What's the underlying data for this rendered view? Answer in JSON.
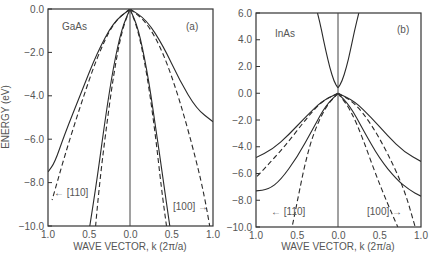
{
  "figure": {
    "shared_xlabel": "WAVE VECTOR, k (2π/a)",
    "shared_ylabel": "ENERGY (eV)"
  },
  "chart_data": [
    {
      "type": "line",
      "panel_label": "(a)",
      "material": "GaAs",
      "title": "GaAs",
      "xlabel": "WAVE VECTOR, k (2π/a)",
      "ylabel": "ENERGY (eV)",
      "x_ticks": [
        "1.0",
        "0.5",
        "0.0",
        "0.5",
        "1.0"
      ],
      "y_ticks": [
        "0.0",
        "−2.0",
        "−4.0",
        "−6.0",
        "−8.0",
        "−10.0"
      ],
      "ylim": [
        -10.0,
        0.0
      ],
      "xlim_left": [
        1.0,
        0.0
      ],
      "xlim_right": [
        0.0,
        1.0
      ],
      "direction_labels": {
        "left": "← [110]",
        "right": "[100] →"
      },
      "grid": false,
      "series": [
        {
          "name": "heavy hole [110] (solid)",
          "style": "solid",
          "side": "left",
          "points": [
            [
              0.0,
              0.0
            ],
            [
              0.2,
              -0.6
            ],
            [
              0.4,
              -2.0
            ],
            [
              0.6,
              -3.9
            ],
            [
              0.8,
              -5.8
            ],
            [
              0.92,
              -7.1
            ],
            [
              1.0,
              -7.5
            ]
          ]
        },
        {
          "name": "heavy hole [110] (model, dashed)",
          "style": "dashed",
          "side": "left",
          "points": [
            [
              0.0,
              0.0
            ],
            [
              0.2,
              -0.6
            ],
            [
              0.4,
              -2.2
            ],
            [
              0.6,
              -4.4
            ],
            [
              0.8,
              -6.8
            ],
            [
              0.95,
              -8.8
            ]
          ]
        },
        {
          "name": "light hole [110] (solid)",
          "style": "solid",
          "side": "left",
          "points": [
            [
              0.0,
              0.0
            ],
            [
              0.1,
              -0.9
            ],
            [
              0.2,
              -2.6
            ],
            [
              0.3,
              -5.0
            ],
            [
              0.4,
              -7.8
            ],
            [
              0.49,
              -10.0
            ]
          ]
        },
        {
          "name": "light hole [110] (model, dashed)",
          "style": "dashed",
          "side": "left",
          "points": [
            [
              0.0,
              0.0
            ],
            [
              0.1,
              -1.0
            ],
            [
              0.2,
              -3.0
            ],
            [
              0.3,
              -5.8
            ],
            [
              0.37,
              -8.0
            ],
            [
              0.42,
              -10.0
            ]
          ]
        },
        {
          "name": "heavy hole [100] (solid)",
          "style": "solid",
          "side": "right",
          "points": [
            [
              0.0,
              0.0
            ],
            [
              0.2,
              -0.5
            ],
            [
              0.4,
              -1.7
            ],
            [
              0.6,
              -3.3
            ],
            [
              0.8,
              -4.6
            ],
            [
              1.0,
              -5.2
            ]
          ]
        },
        {
          "name": "heavy hole [100] (model, dashed)",
          "style": "dashed",
          "side": "right",
          "points": [
            [
              0.0,
              0.0
            ],
            [
              0.2,
              -0.6
            ],
            [
              0.4,
              -2.0
            ],
            [
              0.6,
              -4.2
            ],
            [
              0.8,
              -7.0
            ],
            [
              0.9,
              -8.7
            ],
            [
              0.96,
              -10.0
            ]
          ]
        },
        {
          "name": "light hole [100] (solid)",
          "style": "solid",
          "side": "right",
          "points": [
            [
              0.0,
              0.0
            ],
            [
              0.1,
              -0.9
            ],
            [
              0.2,
              -2.7
            ],
            [
              0.3,
              -5.2
            ],
            [
              0.4,
              -7.9
            ],
            [
              0.48,
              -10.0
            ]
          ]
        },
        {
          "name": "light hole [100] (model, dashed)",
          "style": "dashed",
          "side": "right",
          "points": [
            [
              0.0,
              0.0
            ],
            [
              0.1,
              -1.0
            ],
            [
              0.2,
              -2.9
            ],
            [
              0.3,
              -5.6
            ],
            [
              0.38,
              -8.3
            ],
            [
              0.44,
              -10.0
            ]
          ]
        }
      ]
    },
    {
      "type": "line",
      "panel_label": "(b)",
      "material": "InAs",
      "title": "InAs",
      "xlabel": "WAVE VECTOR, k (2π/a)",
      "ylabel": "ENERGY (eV)",
      "x_ticks": [
        "1.0",
        "0.5",
        "0.0",
        "0.5",
        "1.0"
      ],
      "y_ticks": [
        "6.0",
        "4.0",
        "2.0",
        "0.0",
        "−2.0",
        "−4.0",
        "−6.0",
        "−8.0",
        "−10.0"
      ],
      "ylim": [
        -10.0,
        6.0
      ],
      "xlim_left": [
        1.0,
        0.0
      ],
      "xlim_right": [
        0.0,
        1.0
      ],
      "direction_labels": {
        "left": "← [110]",
        "right": "[100] →"
      },
      "grid": false,
      "series": [
        {
          "name": "conduction band [110]",
          "style": "solid",
          "side": "left",
          "points": [
            [
              0.0,
              0.4
            ],
            [
              0.05,
              0.9
            ],
            [
              0.1,
              1.9
            ],
            [
              0.15,
              3.2
            ],
            [
              0.2,
              4.7
            ],
            [
              0.25,
              6.0
            ]
          ]
        },
        {
          "name": "conduction band [100]",
          "style": "solid",
          "side": "right",
          "points": [
            [
              0.0,
              0.4
            ],
            [
              0.05,
              0.9
            ],
            [
              0.1,
              1.9
            ],
            [
              0.15,
              3.2
            ],
            [
              0.2,
              4.7
            ],
            [
              0.25,
              6.0
            ]
          ]
        },
        {
          "name": "heavy hole [110] (solid)",
          "style": "solid",
          "side": "left",
          "points": [
            [
              0.0,
              0.0
            ],
            [
              0.2,
              -0.6
            ],
            [
              0.4,
              -1.8
            ],
            [
              0.6,
              -3.1
            ],
            [
              0.8,
              -4.2
            ],
            [
              1.0,
              -4.8
            ]
          ]
        },
        {
          "name": "heavy hole [110] (model, dashed)",
          "style": "dashed",
          "side": "left",
          "points": [
            [
              0.0,
              0.0
            ],
            [
              0.2,
              -0.6
            ],
            [
              0.4,
              -2.0
            ],
            [
              0.6,
              -3.6
            ],
            [
              0.8,
              -5.0
            ],
            [
              1.0,
              -6.3
            ]
          ]
        },
        {
          "name": "light hole [110] (solid)",
          "style": "solid",
          "side": "left",
          "points": [
            [
              0.0,
              0.0
            ],
            [
              0.15,
              -0.9
            ],
            [
              0.3,
              -2.6
            ],
            [
              0.5,
              -4.8
            ],
            [
              0.7,
              -6.5
            ],
            [
              0.85,
              -7.2
            ],
            [
              1.0,
              -7.3
            ]
          ]
        },
        {
          "name": "light hole [110] (model, dashed)",
          "style": "dashed",
          "side": "left",
          "points": [
            [
              0.0,
              0.0
            ],
            [
              0.15,
              -1.0
            ],
            [
              0.3,
              -3.0
            ],
            [
              0.4,
              -5.2
            ],
            [
              0.48,
              -7.6
            ],
            [
              0.56,
              -10.0
            ]
          ]
        },
        {
          "name": "heavy hole [100] (solid)",
          "style": "solid",
          "side": "right",
          "points": [
            [
              0.0,
              0.0
            ],
            [
              0.2,
              -0.6
            ],
            [
              0.4,
              -1.8
            ],
            [
              0.6,
              -3.2
            ],
            [
              0.8,
              -4.4
            ],
            [
              1.0,
              -5.1
            ]
          ]
        },
        {
          "name": "heavy hole [100] (model, dashed)",
          "style": "dashed",
          "side": "right",
          "points": [
            [
              0.0,
              0.0
            ],
            [
              0.2,
              -0.7
            ],
            [
              0.4,
              -2.3
            ],
            [
              0.6,
              -4.5
            ],
            [
              0.8,
              -7.2
            ],
            [
              0.93,
              -10.0
            ]
          ]
        },
        {
          "name": "light hole [100] (solid)",
          "style": "solid",
          "side": "right",
          "points": [
            [
              0.0,
              0.0
            ],
            [
              0.15,
              -1.0
            ],
            [
              0.3,
              -2.7
            ],
            [
              0.5,
              -4.9
            ],
            [
              0.7,
              -6.4
            ],
            [
              0.85,
              -7.2
            ],
            [
              1.0,
              -7.7
            ]
          ]
        },
        {
          "name": "light hole [100] (model, dashed)",
          "style": "dashed",
          "side": "right",
          "points": [
            [
              0.0,
              0.0
            ],
            [
              0.15,
              -1.2
            ],
            [
              0.3,
              -3.4
            ],
            [
              0.45,
              -6.0
            ],
            [
              0.6,
              -8.3
            ],
            [
              0.72,
              -10.0
            ]
          ]
        }
      ]
    }
  ]
}
